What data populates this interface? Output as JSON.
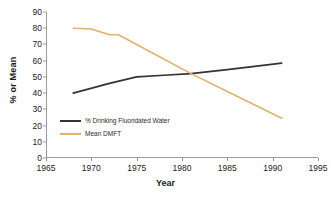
{
  "chart_data": {
    "type": "line",
    "title": "",
    "xlabel": "Year",
    "ylabel": "% or Mean",
    "xlim": [
      1965,
      1995
    ],
    "ylim": [
      0,
      90
    ],
    "xticks": [
      1965,
      1970,
      1975,
      1980,
      1985,
      1990,
      1995
    ],
    "yticks": [
      0,
      10,
      20,
      30,
      40,
      50,
      60,
      70,
      80,
      90
    ],
    "grid": false,
    "legend_position": "lower-left-inside",
    "series": [
      {
        "name": "% Drinking Fluoridated Water",
        "color": "#333333",
        "x": [
          1968,
          1972,
          1975,
          1978,
          1981,
          1985,
          1988,
          1991
        ],
        "values": [
          40,
          46,
          50,
          51,
          52,
          54.5,
          56.5,
          58.5
        ]
      },
      {
        "name": "Mean DMFT",
        "color": "#E3B269",
        "x": [
          1968,
          1970,
          1972,
          1973,
          1977,
          1981,
          1985,
          1991
        ],
        "values": [
          80,
          79.5,
          76,
          76,
          64,
          52,
          41,
          24.5
        ]
      }
    ]
  },
  "axes": {
    "ylabel_text": "% or Mean",
    "xlabel_text": "Year",
    "ytick_labels": [
      "0",
      "10",
      "20",
      "30",
      "40",
      "50",
      "60",
      "70",
      "80",
      "90"
    ],
    "xtick_labels": [
      "1965",
      "1970",
      "1975",
      "1980",
      "1985",
      "1990",
      "1995"
    ]
  },
  "legend": {
    "items": [
      {
        "label": "% Drinking Fluoridated Water",
        "color": "#333333"
      },
      {
        "label": "Mean DMFT",
        "color": "#E3B269"
      }
    ]
  },
  "colors": {
    "background": "#ffffff",
    "axis": "#9a9a9a",
    "text": "#1a1a1a",
    "series_fluoridated": "#333333",
    "series_dmft": "#E3B269"
  }
}
